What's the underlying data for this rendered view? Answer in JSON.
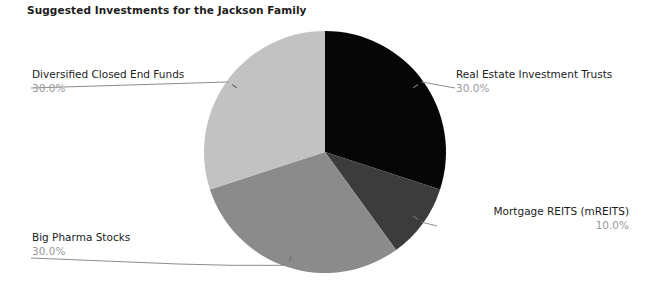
{
  "chart_data": {
    "type": "pie",
    "title": "Suggested Investments for the Jackson Family",
    "xlabel": "",
    "ylabel": "",
    "legend_position": "none",
    "grid": false,
    "start_angle_deg": 0,
    "direction": "clockwise",
    "categories": [
      "Real Estate Investment Trusts",
      "Mortgage REITS (mREITS)",
      "Big Pharma Stocks",
      "Diversified Closed End Funds"
    ],
    "values": [
      30.0,
      10.0,
      30.0,
      30.0
    ],
    "value_labels": [
      "30.0%",
      "10.0%",
      "30.0%",
      "30.0%"
    ],
    "colors": [
      "#060606",
      "#3c3c3c",
      "#8b8b8b",
      "#c2c2c2"
    ],
    "slices": [
      {
        "label": "Real Estate Investment Trusts",
        "value": 30.0,
        "value_label": "30.0%",
        "color": "#060606"
      },
      {
        "label": "Mortgage REITS (mREITS)",
        "value": 10.0,
        "value_label": "10.0%",
        "color": "#3c3c3c"
      },
      {
        "label": "Big Pharma Stocks",
        "value": 30.0,
        "value_label": "30.0%",
        "color": "#8b8b8b"
      },
      {
        "label": "Diversified Closed End Funds",
        "value": 30.0,
        "value_label": "30.0%",
        "color": "#c2c2c2"
      }
    ]
  },
  "geometry": {
    "center_x": 325,
    "center_y": 152,
    "radius": 121
  },
  "style": {
    "background": "#ffffff",
    "title_color": "#1c1c1c",
    "label_color": "#1c1c1c",
    "value_color": "#9a9a9a",
    "leader_color": "#8d8d8d"
  }
}
